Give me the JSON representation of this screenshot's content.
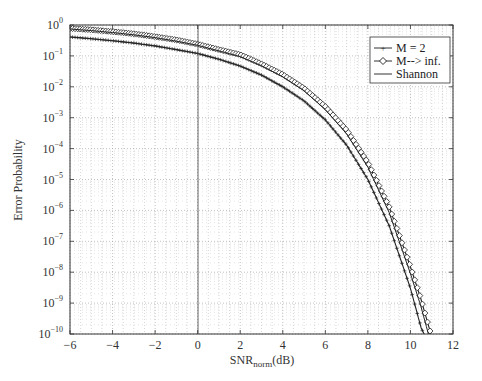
{
  "chart_data": {
    "type": "line",
    "title": "",
    "xlabel": "SNR_norm(dB)",
    "xlabel_main": "SNR",
    "xlabel_sub": "norm",
    "xlabel_suffix": "(dB)",
    "ylabel": "Error Probability",
    "xlim": [
      -6,
      12
    ],
    "ylim": [
      1e-10,
      1
    ],
    "yscale": "log",
    "grid": true,
    "legend_position": "upper right",
    "x_ticks": [
      -6,
      -4,
      -2,
      0,
      2,
      4,
      6,
      8,
      10,
      12
    ],
    "x_tick_labels": [
      "−6",
      "−4",
      "−2",
      "0",
      "2",
      "4",
      "6",
      "8",
      "10",
      "12"
    ],
    "y_ticks_exp": [
      0,
      -1,
      -2,
      -3,
      -4,
      -5,
      -6,
      -7,
      -8,
      -9,
      -10
    ],
    "series": [
      {
        "name": "M = 2",
        "marker": "+",
        "x": [
          -6,
          -5,
          -4,
          -3,
          -2,
          -1,
          0,
          1,
          2,
          3,
          4,
          5,
          6,
          7,
          8,
          9,
          10,
          10.5,
          11,
          11.3
        ],
        "values": [
          0.41,
          0.36,
          0.31,
          0.26,
          0.21,
          0.16,
          0.12,
          0.078,
          0.047,
          0.024,
          0.01,
          0.0035,
          0.00085,
          0.00013,
          1e-05,
          3.2e-07,
          3e-09,
          1.6e-10,
          3e-11,
          7e-12
        ]
      },
      {
        "name": "M--> inf.",
        "marker": "diamond",
        "x": [
          -6,
          -5,
          -4,
          -3,
          -2,
          -1,
          0,
          1,
          2,
          3,
          4,
          5,
          6,
          7,
          8,
          9,
          10,
          10.5,
          11,
          11.5
        ],
        "values": [
          0.78,
          0.7,
          0.61,
          0.52,
          0.42,
          0.33,
          0.24,
          0.16,
          0.11,
          0.055,
          0.025,
          0.009,
          0.0023,
          0.0004,
          3.5e-05,
          1.3e-06,
          1.5e-08,
          1.3e-09,
          8e-11,
          3e-12
        ]
      },
      {
        "name": "Shannon",
        "marker": "none",
        "x": [
          -6,
          -5,
          -4,
          -3,
          -2,
          -1,
          0,
          1,
          2,
          3,
          4,
          5,
          6,
          7,
          8,
          9,
          10,
          10.5,
          11,
          11.4
        ],
        "values": [
          0.74,
          0.66,
          0.57,
          0.48,
          0.39,
          0.3,
          0.22,
          0.145,
          0.095,
          0.048,
          0.021,
          0.0075,
          0.0018,
          0.0003,
          2.5e-05,
          8.5e-07,
          9e-09,
          7.5e-10,
          4e-11,
          4e-12
        ]
      }
    ]
  },
  "legend": {
    "items": [
      "M = 2",
      "M--> inf.",
      "Shannon"
    ]
  }
}
